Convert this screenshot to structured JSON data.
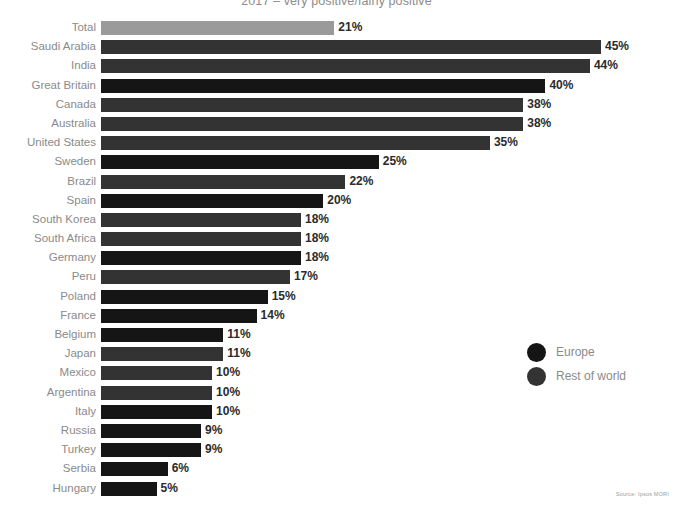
{
  "chart_data": {
    "type": "bar",
    "orientation": "horizontal",
    "title": "2017 – very positive/fairly positive",
    "xlabel": "",
    "ylabel": "",
    "xlim": [
      0,
      45
    ],
    "grid": false,
    "value_suffix": "%",
    "legend": {
      "position": "middle-right",
      "entries": [
        {
          "label": "Europe",
          "color": "#151515",
          "group": "europe"
        },
        {
          "label": "Rest of world",
          "color": "#333333",
          "group": "rest"
        }
      ]
    },
    "categories": [
      "Total",
      "Saudi Arabia",
      "India",
      "Great Britain",
      "Canada",
      "Australia",
      "United States",
      "Sweden",
      "Brazil",
      "Spain",
      "South Korea",
      "South Africa",
      "Germany",
      "Peru",
      "Poland",
      "France",
      "Belgium",
      "Japan",
      "Mexico",
      "Argentina",
      "Italy",
      "Russia",
      "Turkey",
      "Serbia",
      "Hungary"
    ],
    "values": [
      21,
      45,
      44,
      40,
      38,
      38,
      35,
      25,
      22,
      20,
      18,
      18,
      18,
      17,
      15,
      14,
      11,
      11,
      10,
      10,
      10,
      9,
      9,
      6,
      5
    ],
    "value_labels": [
      "21%",
      "45%",
      "44%",
      "40%",
      "38%",
      "38%",
      "35%",
      "25%",
      "22%",
      "20%",
      "18%",
      "18%",
      "18%",
      "17%",
      "15%",
      "14%",
      "11%",
      "11%",
      "10%",
      "10%",
      "10%",
      "9%",
      "9%",
      "6%",
      "5%"
    ],
    "groups": [
      "total",
      "rest",
      "rest",
      "europe",
      "rest",
      "rest",
      "rest",
      "europe",
      "rest",
      "europe",
      "rest",
      "rest",
      "europe",
      "rest",
      "europe",
      "europe",
      "europe",
      "rest",
      "rest",
      "rest",
      "europe",
      "europe",
      "europe",
      "europe",
      "europe"
    ],
    "colors": {
      "total": "#9a9a9a",
      "europe": "#151515",
      "rest": "#333333",
      "label_text": "#8a8a8a",
      "value_text": "#2b2b2b",
      "background": "#ffffff"
    }
  },
  "source_note": "Source: Ipsos MORI"
}
